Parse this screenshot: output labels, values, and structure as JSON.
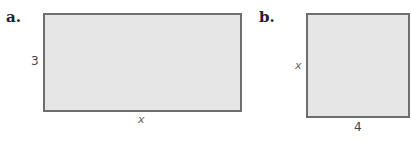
{
  "figures": [
    {
      "label": "a.",
      "shape": "rectangle",
      "height_label": "3",
      "width_label": "x"
    },
    {
      "label": "b.",
      "shape": "rectangle",
      "height_label": "x",
      "width_label": "4"
    }
  ],
  "colors": {
    "fill": "#e6e6e6",
    "stroke": "#6e6e6e"
  }
}
